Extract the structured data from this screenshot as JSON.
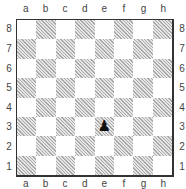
{
  "board": {
    "files": [
      "a",
      "b",
      "c",
      "d",
      "e",
      "f",
      "g",
      "h"
    ],
    "ranks": [
      "8",
      "7",
      "6",
      "5",
      "4",
      "3",
      "2",
      "1"
    ],
    "light_color": "#ffffff",
    "dark_color": "#bdbdbd",
    "pieces": [
      {
        "square": "e3",
        "piece": "black-pawn",
        "glyph": "♟"
      }
    ]
  }
}
